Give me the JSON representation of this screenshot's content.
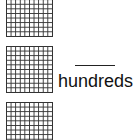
{
  "hundreds_blocks": [
    {
      "rows": 10,
      "cols": 10
    },
    {
      "rows": 10,
      "cols": 10
    },
    {
      "rows": 10,
      "cols": 10
    }
  ],
  "answer": {
    "value": "",
    "label": "hundreds"
  },
  "colors": {
    "grid_line": "#333333",
    "text": "#111111"
  }
}
